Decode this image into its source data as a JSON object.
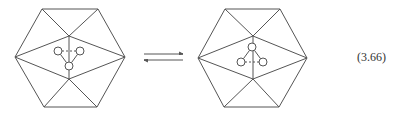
{
  "equation_label": "(3.66)",
  "colors": {
    "stroke": "#555555",
    "background": "#ffffff"
  },
  "diagram": {
    "left_structure": {
      "hexagon": [
        [
          42,
          9
        ],
        [
          98,
          9
        ],
        [
          125,
          57
        ],
        [
          97,
          107
        ],
        [
          44,
          107
        ],
        [
          15,
          57
        ]
      ],
      "inner_top": [
        69,
        36
      ],
      "inner_bottom": [
        69,
        79
      ],
      "circles": [
        [
          58,
          51
        ],
        [
          80,
          51
        ],
        [
          69,
          66
        ]
      ],
      "dashed_bond": [
        0,
        1
      ],
      "solid_bonds": [
        [
          0,
          2
        ],
        [
          1,
          2
        ]
      ]
    },
    "right_structure": {
      "hexagon": [
        [
          225,
          9
        ],
        [
          280,
          9
        ],
        [
          307,
          58
        ],
        [
          279,
          107
        ],
        [
          224,
          107
        ],
        [
          198,
          58
        ]
      ],
      "inner_top": [
        253,
        36
      ],
      "inner_bottom": [
        253,
        79
      ],
      "circles": [
        [
          252,
          47
        ],
        [
          241,
          62
        ],
        [
          263,
          62
        ]
      ],
      "dashed_bond": [
        1,
        2
      ],
      "solid_bonds": [
        [
          0,
          1
        ],
        [
          0,
          2
        ]
      ]
    },
    "arrows": {
      "type": "equilibrium",
      "forward": {
        "from": [
          144,
          54
        ],
        "to": [
          183,
          54
        ]
      },
      "reverse": {
        "from": [
          183,
          60
        ],
        "to": [
          144,
          60
        ]
      }
    }
  }
}
